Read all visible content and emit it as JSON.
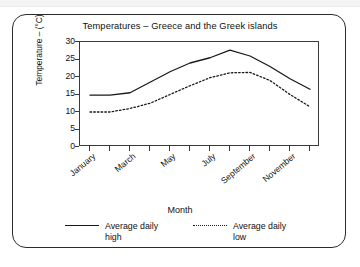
{
  "figure": {
    "title": "Temperatures – Greece and the Greek islands",
    "x_axis_title": "Month",
    "y_axis_title": "Temperature – (°C)"
  },
  "legend": {
    "items": [
      {
        "label": "Average daily high",
        "style": "solid",
        "swatch_icon": "solid-line-icon"
      },
      {
        "label": "Average daily low",
        "style": "dotted",
        "swatch_icon": "dotted-line-icon"
      }
    ]
  },
  "chart_data": {
    "type": "line",
    "title": "Temperatures – Greece and the Greek islands",
    "xlabel": "Month",
    "ylabel": "Temperature – (°C)",
    "ylim": [
      0,
      30
    ],
    "yticks": [
      0,
      5,
      10,
      15,
      20,
      25,
      30
    ],
    "ytick_labels": [
      "0",
      "5",
      "10",
      "15",
      "20",
      "25",
      "30"
    ],
    "grid": false,
    "legend_position": "bottom",
    "categories": [
      "January",
      "February",
      "March",
      "April",
      "May",
      "June",
      "July",
      "August",
      "September",
      "October",
      "November",
      "December"
    ],
    "xtick_labels_shown": [
      "January",
      "March",
      "May",
      "July",
      "September",
      "November"
    ],
    "series": [
      {
        "name": "Average daily high",
        "style": "solid",
        "color": "#1a1a1a",
        "values": [
          14.8,
          14.8,
          15.5,
          18.5,
          21.5,
          24.0,
          25.5,
          27.7,
          26.0,
          23.0,
          19.5,
          16.5
        ]
      },
      {
        "name": "Average daily low",
        "style": "dotted",
        "color": "#1a1a1a",
        "values": [
          10.0,
          10.0,
          11.0,
          12.5,
          15.0,
          17.5,
          19.8,
          21.2,
          21.3,
          19.0,
          15.0,
          11.5
        ]
      }
    ]
  }
}
